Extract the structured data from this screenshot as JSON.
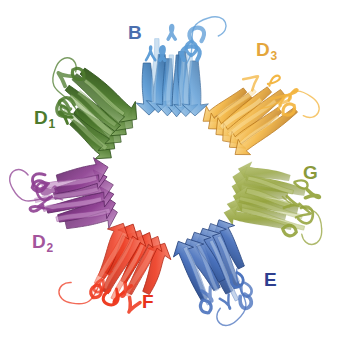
{
  "figure": {
    "caption_title": "Heptameric protein ring, ribbon representation",
    "background_color": "#ffffff",
    "width": 343,
    "height": 352,
    "center": {
      "x": 172,
      "y": 176
    },
    "subunit_count": 7,
    "view": "top view down the 7-fold axis",
    "center_pore": "open / hollow"
  },
  "subunits": [
    {
      "id": "B",
      "label": "B",
      "subscript": "",
      "label_color": "#4a6fae",
      "ribbon_color": "#5b9bd5",
      "ribbon_color_dark": "#2c5f94",
      "ribbon_color_light": "#a8cbe8",
      "label_x": 128,
      "label_y": 23,
      "angle_deg": 270,
      "fold": "beta-sandwich"
    },
    {
      "id": "D3",
      "label": "D",
      "subscript": "3",
      "label_color": "#e4a63c",
      "ribbon_color": "#f3b43d",
      "ribbon_color_dark": "#b9761a",
      "ribbon_color_light": "#fbdf9a",
      "label_x": 256,
      "label_y": 40,
      "angle_deg": 321,
      "fold": "beta-sandwich"
    },
    {
      "id": "G",
      "label": "G",
      "subscript": "",
      "label_color": "#8a9a3a",
      "ribbon_color": "#94a33c",
      "ribbon_color_dark": "#62702010",
      "ribbon_color_light": "#bcc77d",
      "label_x": 303,
      "label_y": 163,
      "angle_deg": 14,
      "fold": "beta-sandwich"
    },
    {
      "id": "E",
      "label": "E",
      "subscript": "",
      "label_color": "#2e3f8f",
      "ribbon_color": "#4a72bd",
      "ribbon_color_dark": "#27457f",
      "ribbon_color_light": "#a9c0e2",
      "label_x": 264,
      "label_y": 270,
      "angle_deg": 64,
      "fold": "beta-sandwich"
    },
    {
      "id": "F",
      "label": "F",
      "subscript": "",
      "label_color": "#e8321b",
      "ribbon_color": "#ee3a20",
      "ribbon_color_dark": "#b01f0c",
      "ribbon_color_light": "#f78a74",
      "label_x": 142,
      "label_y": 292,
      "angle_deg": 116,
      "fold": "beta-sandwich"
    },
    {
      "id": "D2",
      "label": "D",
      "subscript": "2",
      "label_color": "#a3559c",
      "ribbon_color": "#8d3f91",
      "ribbon_color_dark": "#5f2766",
      "ribbon_color_light": "#c48ec6",
      "label_x": 32,
      "label_y": 232,
      "angle_deg": 167,
      "fold": "beta-sandwich"
    },
    {
      "id": "D1",
      "label": "D",
      "subscript": "1",
      "label_color": "#4d7a2c",
      "ribbon_color": "#4e7b2e",
      "ribbon_color_dark": "#2f531a",
      "ribbon_color_light": "#9dbd7c",
      "label_x": 34,
      "label_y": 108,
      "angle_deg": 218,
      "fold": "beta-sandwich"
    }
  ]
}
